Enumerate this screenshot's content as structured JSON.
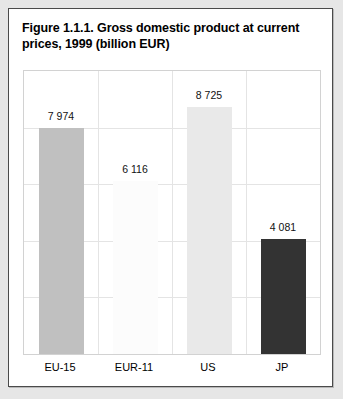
{
  "figure": {
    "title": "Figure 1.1.1. Gross domestic product at current prices, 1999 (billion EUR)"
  },
  "chart_data": {
    "type": "bar",
    "title": "Figure 1.1.1. Gross domestic product at current prices, 1999 (billion EUR)",
    "xlabel": "",
    "ylabel": "",
    "ylim": [
      0,
      10000
    ],
    "grid": true,
    "legend": "none",
    "categories": [
      "EU-15",
      "EUR-11",
      "US",
      "JP"
    ],
    "values": [
      7974,
      6116,
      8725,
      4081
    ],
    "value_labels": [
      "7 974",
      "6 116",
      "8 725",
      "4 081"
    ],
    "bar_colors": [
      "#c0c0c0",
      "#fcfcfc",
      "#e9e9e9",
      "#333333"
    ],
    "gridline_values": [
      8000,
      6000,
      4000,
      2000
    ]
  }
}
